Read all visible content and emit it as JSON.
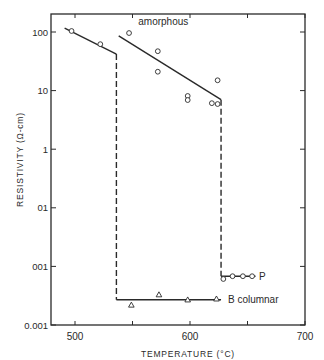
{
  "chart_data": {
    "type": "line",
    "title": "",
    "xlabel": "TEMPERATURE (°C)",
    "ylabel": "RESISTIVITY (Ω-cm)",
    "xlim": [
      479,
      700
    ],
    "ylim": [
      0.001,
      200
    ],
    "yscale": "log",
    "xticks": [
      500,
      600,
      700
    ],
    "xticks_minor": [
      550,
      650
    ],
    "xtick_labels": [
      "500",
      "600",
      "700"
    ],
    "yticks": [
      100,
      10,
      1,
      0.1,
      0.01,
      0.001
    ],
    "ytick_labels": [
      "100",
      "10",
      "1",
      "01",
      "001",
      "0.001"
    ],
    "grid": false,
    "series": [
      {
        "name": "low-temperature branch",
        "style": "solid",
        "line": [
          [
            491,
            117
          ],
          [
            536,
            42
          ]
        ],
        "marker": "circle",
        "points": [
          [
            497,
            104
          ],
          [
            522,
            62
          ]
        ]
      },
      {
        "name": "transition 1",
        "style": "dashed",
        "line": [
          [
            536,
            42
          ],
          [
            536,
            0.0027
          ]
        ]
      },
      {
        "name": "amorphous",
        "label": "amorphous",
        "style": "solid",
        "line": [
          [
            538,
            86
          ],
          [
            627,
            7
          ]
        ],
        "marker": "circle",
        "points": [
          [
            547,
            96
          ],
          [
            572,
            47
          ],
          [
            572,
            21
          ],
          [
            598,
            8.1
          ],
          [
            598,
            6.9
          ],
          [
            624,
            15
          ],
          [
            619,
            6.1
          ],
          [
            624,
            5.9
          ]
        ]
      },
      {
        "name": "B columnar",
        "label": "B columnar",
        "style": "solid",
        "line": [
          [
            536,
            0.0027
          ],
          [
            627,
            0.0027
          ]
        ],
        "marker": "triangle",
        "points": [
          [
            549,
            0.0022
          ],
          [
            573,
            0.0033
          ],
          [
            598,
            0.0027
          ],
          [
            623,
            0.0028
          ]
        ]
      },
      {
        "name": "transition 2",
        "style": "dashed",
        "line": [
          [
            627,
            7
          ],
          [
            627,
            0.0068
          ]
        ]
      },
      {
        "name": "P",
        "label": "P",
        "style": "solid",
        "line": [
          [
            627,
            0.0068
          ],
          [
            657,
            0.0068
          ]
        ],
        "marker": "circle",
        "points": [
          [
            629,
            0.0061
          ],
          [
            637,
            0.0068
          ],
          [
            646,
            0.0068
          ],
          [
            654,
            0.0068
          ]
        ]
      }
    ],
    "annotations": [
      {
        "text": "amorphous",
        "x": 555,
        "y": 150
      },
      {
        "text": "P",
        "x": 660,
        "y": 0.0068
      },
      {
        "text": "B columnar",
        "x": 633,
        "y": 0.0027
      }
    ]
  }
}
